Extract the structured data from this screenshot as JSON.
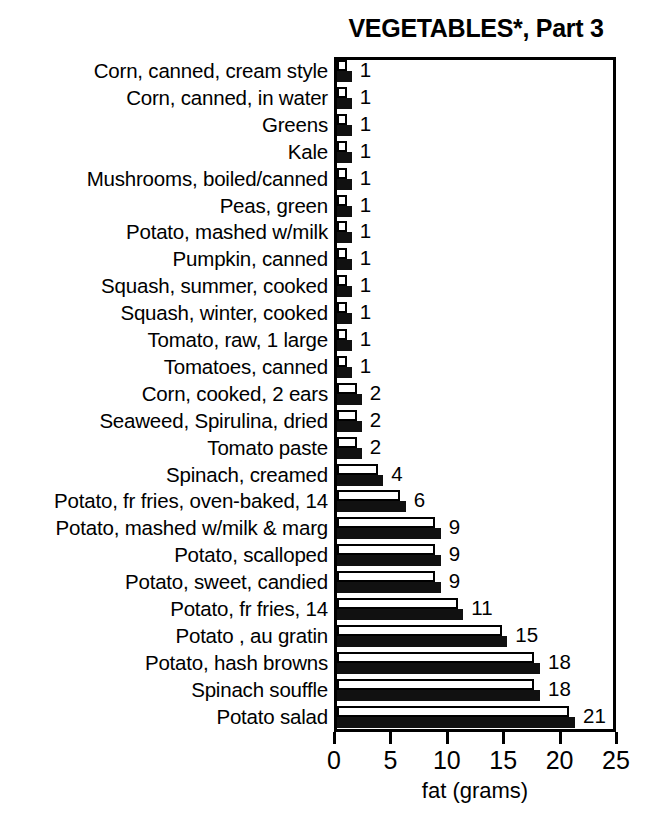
{
  "chart_data": {
    "type": "bar",
    "title": "VEGETABLES*, Part 3",
    "xlabel": "fat (grams)",
    "ylabel": "",
    "orientation": "horizontal",
    "xlim": [
      0,
      25
    ],
    "xticks": [
      0,
      5,
      10,
      15,
      20,
      25
    ],
    "xtick_labels": [
      "0",
      "5",
      "10",
      "15",
      "20",
      "25"
    ],
    "grid": false,
    "legend": "none",
    "categories": [
      "Corn, canned, cream style",
      "Corn, canned, in water",
      "Greens",
      "Kale",
      "Mushrooms, boiled/canned",
      "Peas, green",
      "Potato, mashed w/milk",
      "Pumpkin, canned",
      "Squash, summer, cooked",
      "Squash, winter, cooked",
      "Tomato, raw, 1 large",
      "Tomatoes, canned",
      "Corn, cooked, 2 ears",
      "Seaweed, Spirulina, dried",
      "Tomato paste",
      "Spinach, creamed",
      "Potato, fr fries, oven-baked, 14",
      "Potato, mashed w/milk & marg",
      "Potato, scalloped",
      "Potato, sweet, candied",
      "Potato, fr fries, 14",
      "Potato , au gratin",
      "Potato, hash browns",
      "Spinach souffle",
      "Potato salad"
    ],
    "values": [
      1,
      1,
      1,
      1,
      1,
      1,
      1,
      1,
      1,
      1,
      1,
      1,
      2,
      2,
      2,
      4,
      6,
      9,
      9,
      9,
      11,
      15,
      18,
      18,
      21
    ],
    "value_labels": [
      "1",
      "1",
      "1",
      "1",
      "1",
      "1",
      "1",
      "1",
      "1",
      "1",
      "1",
      "1",
      "2",
      "2",
      "2",
      "4",
      "6",
      "9",
      "9",
      "9",
      "11",
      "15",
      "18",
      "18",
      "21"
    ],
    "series": [
      {
        "name": "open-bar",
        "style": "white-fill-black-outline",
        "values": [
          0.9,
          0.9,
          0.9,
          0.9,
          0.9,
          0.9,
          0.9,
          0.9,
          0.9,
          0.9,
          0.9,
          0.9,
          1.8,
          1.8,
          1.8,
          3.6,
          5.6,
          8.7,
          8.7,
          8.7,
          10.7,
          14.6,
          17.5,
          17.5,
          20.6
        ]
      },
      {
        "name": "solid-bar",
        "style": "black-fill",
        "values": [
          1.3,
          1.3,
          1.3,
          1.3,
          1.3,
          1.3,
          1.3,
          1.3,
          1.3,
          1.3,
          1.3,
          1.3,
          2.2,
          2.2,
          2.2,
          4.1,
          6.1,
          9.2,
          9.2,
          9.2,
          11.2,
          15.1,
          18.0,
          18.0,
          21.1
        ]
      }
    ]
  },
  "colors": {
    "background": "#ffffff",
    "foreground": "#000000",
    "bar_solid": "#111111",
    "bar_open_fill": "#ffffff"
  }
}
